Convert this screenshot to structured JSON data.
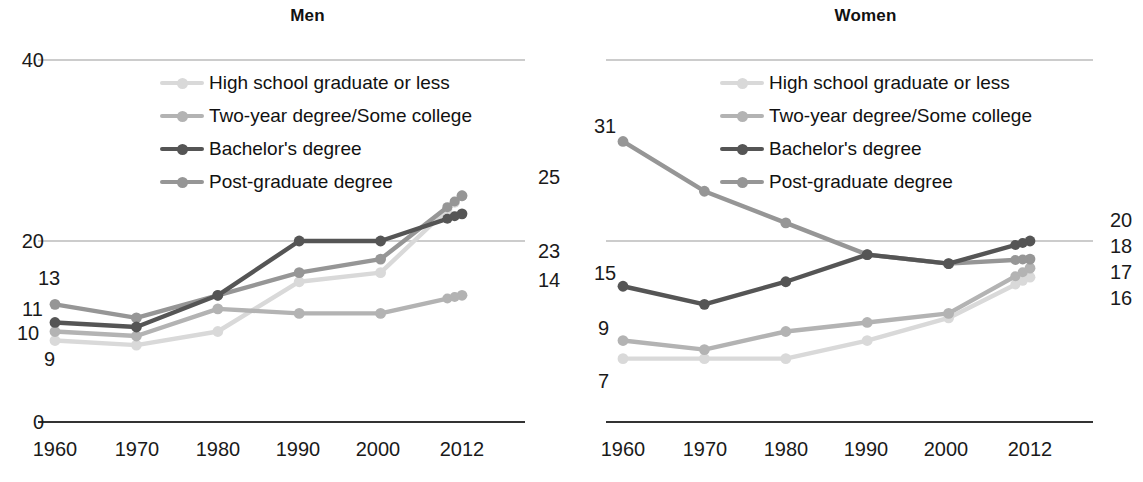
{
  "chart_data": {
    "type": "line",
    "panels": [
      {
        "key": "men",
        "title": "Men",
        "x": [
          "1960",
          "1970",
          "1980",
          "1990",
          "2000",
          "2012"
        ],
        "xlabel": "",
        "ylabel": "",
        "ylim": [
          0,
          40
        ],
        "yticks": [
          "0",
          "20",
          "40"
        ],
        "grid": true,
        "legend_position": "inside-top",
        "series": [
          {
            "name": "High school graduate or less",
            "color": "#d9d9d9",
            "values": [
              9,
              8.5,
              10,
              15.5,
              16.5,
              25
            ],
            "start_label": "9",
            "end_label": "25"
          },
          {
            "name": "Two-year degree/Some college",
            "color": "#b3b3b3",
            "values": [
              10,
              9.5,
              12.5,
              12,
              12,
              14
            ],
            "start_label": "10",
            "end_label": "14"
          },
          {
            "name": "Bachelor's degree",
            "color": "#555555",
            "values": [
              11,
              10.5,
              14,
              20,
              20,
              23
            ],
            "start_label": "11",
            "end_label": "23"
          },
          {
            "name": "Post-graduate degree",
            "color": "#969696",
            "values": [
              13,
              11.5,
              14,
              16.5,
              18,
              25
            ],
            "start_label": "13",
            "end_label": ""
          }
        ]
      },
      {
        "key": "women",
        "title": "Women",
        "x": [
          "1960",
          "1970",
          "1980",
          "1990",
          "2000",
          "2012"
        ],
        "xlabel": "",
        "ylabel": "",
        "ylim": [
          0,
          40
        ],
        "yticks": [
          "0",
          "20",
          "40"
        ],
        "grid": true,
        "legend_position": "inside-top",
        "series": [
          {
            "name": "High school graduate or less",
            "color": "#d9d9d9",
            "values": [
              7,
              7,
              7,
              9,
              11.5,
              16
            ],
            "start_label": "7",
            "end_label": "16"
          },
          {
            "name": "Two-year degree/Some college",
            "color": "#b3b3b3",
            "values": [
              9,
              8,
              10,
              11,
              12,
              17
            ],
            "start_label": "9",
            "end_label": "17"
          },
          {
            "name": "Bachelor's degree",
            "color": "#555555",
            "values": [
              15,
              13,
              15.5,
              18.5,
              17.5,
              20
            ],
            "start_label": "15",
            "end_label": "20"
          },
          {
            "name": "Post-graduate degree",
            "color": "#969696",
            "values": [
              31,
              25.5,
              22,
              18.5,
              17.5,
              18
            ],
            "start_label": "31",
            "end_label": "18"
          }
        ]
      }
    ]
  },
  "legend": {
    "items": [
      {
        "label": "High school graduate or less",
        "color": "#d9d9d9"
      },
      {
        "label": "Two-year degree/Some college",
        "color": "#b3b3b3"
      },
      {
        "label": "Bachelor's degree",
        "color": "#555555"
      },
      {
        "label": "Post-graduate degree",
        "color": "#969696"
      }
    ]
  },
  "colors": {
    "axis": "#333333",
    "gridline": "#999999",
    "text": "#1a1a1a",
    "background": "#ffffff"
  }
}
